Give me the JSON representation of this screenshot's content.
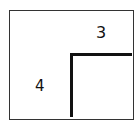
{
  "diagram": {
    "labels": {
      "left": "4",
      "top": "3"
    },
    "colors": {
      "stroke": "#111111",
      "border": "#333333",
      "background": "#ffffff"
    }
  }
}
